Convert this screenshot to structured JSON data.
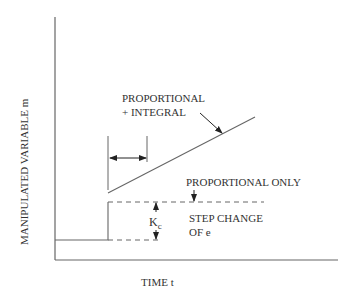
{
  "diagram": {
    "y_axis_label": "MANIPULATED VARIABLE  m",
    "x_axis_label": "TIME  t",
    "labels": {
      "pi_line1": "PROPORTIONAL",
      "pi_line2": "+ INTEGRAL",
      "p_only": "PROPORTIONAL ONLY",
      "step_line1": "STEP CHANGE",
      "step_line2": "OF  e",
      "kc_main": "K",
      "kc_sub": "c"
    },
    "colors": {
      "line": "#555555",
      "text": "#333333"
    }
  }
}
